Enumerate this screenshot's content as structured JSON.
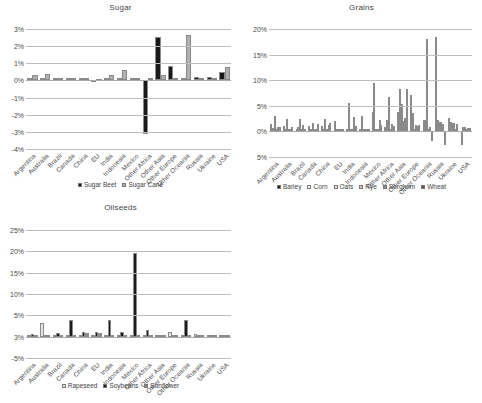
{
  "categories": [
    "Argentina",
    "Australia",
    "Brazil",
    "Canada",
    "China",
    "EU",
    "India",
    "Indonesia",
    "Mexico",
    "Other Africa",
    "Other Asia",
    "Other Europe",
    "Other Oceania",
    "Russia",
    "Ukraine",
    "USA"
  ],
  "colors": {
    "black": "#1a1a1a",
    "white": "#fdfdfd",
    "light_gray": "#e3e3e3",
    "mid_gray": "#b0b0b0",
    "dark_gray": "#7d7d7d",
    "darker_gray": "#5a5a5a",
    "gridline": "#bfbfbf"
  },
  "charts": [
    {
      "id": "sugar",
      "title": "Sugar",
      "type": "bar",
      "xlabel": "",
      "ylabel": "",
      "ylim": [
        -4,
        3
      ],
      "yticks": [
        "3%",
        "2%",
        "1%",
        "0%",
        "-1%",
        "-2%",
        "-3%",
        "-4%"
      ],
      "ytick_values": [
        3,
        2,
        1,
        0,
        -1,
        -2,
        -3,
        -4
      ],
      "grid": true,
      "legend_position": "bottom",
      "series": [
        {
          "name": "Sugar Beet",
          "color": "#1a1a1a",
          "values": [
            0.02,
            0.02,
            0.12,
            0.02,
            0.03,
            -0.08,
            0.02,
            0.02,
            0.02,
            -3.1,
            2.55,
            0.82,
            0.0,
            0.18,
            0.2,
            0.52
          ]
        },
        {
          "name": "Sugar Cane",
          "color": "#b0b0b0",
          "values": [
            0.3,
            0.35,
            0.12,
            0.14,
            0.07,
            -0.04,
            0.3,
            0.6,
            0.1,
            0.06,
            0.3,
            0.0,
            2.68,
            0.07,
            0.0,
            0.8
          ]
        }
      ]
    },
    {
      "id": "grains",
      "title": "Grains",
      "type": "bar",
      "xlabel": "",
      "ylabel": "",
      "ylim": [
        -5,
        20
      ],
      "yticks": [
        "20%",
        "15%",
        "10%",
        "5%",
        "0%",
        "5%"
      ],
      "ytick_values": [
        20,
        15,
        10,
        5,
        0,
        -5
      ],
      "grid": true,
      "legend_position": "bottom",
      "series": [
        {
          "name": "Barley",
          "color": "#1a1a1a",
          "values": [
            1.4,
            1.1,
            0.4,
            1.0,
            1.0,
            2.1,
            0.15,
            0.0,
            3.85,
            0.9,
            3.85,
            7.1,
            2.2,
            18.4,
            2.6,
            -2.6
          ]
        },
        {
          "name": "Corn",
          "color": "#fdfdfd",
          "values": [
            0.7,
            0.15,
            0.9,
            0.2,
            0.25,
            0.15,
            5.5,
            3.0,
            9.5,
            2.2,
            8.2,
            3.6,
            2.2,
            2.2,
            1.8,
            0.9
          ]
        },
        {
          "name": "Oats",
          "color": "#e3e3e3",
          "values": [
            3.1,
            2.4,
            2.4,
            1.6,
            2.4,
            0.0,
            0.0,
            0.0,
            0.0,
            6.8,
            5.4,
            0.0,
            18.1,
            1.9,
            1.6,
            0.8
          ]
        },
        {
          "name": "Rye",
          "color": "#c9c9c9",
          "values": [
            0.0,
            0.0,
            0.0,
            0.0,
            0.0,
            0.0,
            0.0,
            0.0,
            0.0,
            0.0,
            2.0,
            1.3,
            0.0,
            1.9,
            1.6,
            0.5
          ]
        },
        {
          "name": "Sorghum",
          "color": "#8c8c8c",
          "values": [
            0.9,
            0.5,
            1.2,
            0.0,
            1.3,
            0.1,
            2.9,
            0.0,
            2.3,
            1.5,
            2.6,
            1.1,
            0.9,
            1.5,
            0.4,
            0.6
          ]
        },
        {
          "name": "Wheat",
          "color": "#5a5a5a",
          "values": [
            0.9,
            0.9,
            0.5,
            1.5,
            1.6,
            0.1,
            1.1,
            0.1,
            1.2,
            1.1,
            8.2,
            1.3,
            -1.9,
            -2.6,
            1.4,
            0.6
          ]
        }
      ]
    },
    {
      "id": "oilseeds",
      "title": "Oilseeds",
      "type": "bar",
      "xlabel": "",
      "ylabel": "",
      "ylim": [
        -5,
        25
      ],
      "yticks": [
        "25%",
        "20%",
        "15%",
        "10%",
        "5%",
        "3%",
        "-5%"
      ],
      "ytick_values": [
        25,
        20,
        15,
        10,
        5,
        0,
        -5
      ],
      "grid": true,
      "legend_position": "bottom",
      "series": [
        {
          "name": "Rapeseed",
          "color": "#e3e3e3",
          "values": [
            0.1,
            3.3,
            0.0,
            0.3,
            0.2,
            0.3,
            0.2,
            0.0,
            0.0,
            0.0,
            0.3,
            1.1,
            0.4,
            0.6,
            0.0,
            0.0
          ]
        },
        {
          "name": "Soybeans",
          "color": "#1a1a1a",
          "values": [
            0.6,
            0.0,
            0.8,
            3.9,
            1.2,
            1.2,
            3.8,
            1.1,
            19.5,
            1.5,
            0.2,
            0.2,
            3.9,
            0.3,
            0.1,
            0.1
          ]
        },
        {
          "name": "Sunflower",
          "color": "#8c8c8c",
          "values": [
            0.5,
            0.0,
            0.0,
            0.1,
            0.8,
            0.9,
            0.1,
            0.0,
            0.2,
            0.5,
            0.3,
            0.1,
            0.5,
            0.4,
            0.1,
            0.0
          ]
        }
      ]
    }
  ]
}
